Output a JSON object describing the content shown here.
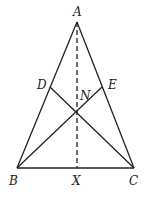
{
  "diagram": {
    "type": "geometry",
    "points": {
      "A": {
        "label": "A",
        "x": 77,
        "y": 22
      },
      "B": {
        "label": "B",
        "x": 17,
        "y": 168
      },
      "C": {
        "label": "C",
        "x": 134,
        "y": 168
      },
      "D": {
        "label": "D",
        "x": 50,
        "y": 87
      },
      "E": {
        "label": "E",
        "x": 102,
        "y": 87
      },
      "N": {
        "label": "N",
        "x": 77,
        "y": 111
      },
      "X": {
        "label": "X",
        "x": 77,
        "y": 168
      }
    },
    "segments": [
      {
        "from": "A",
        "to": "B",
        "style": "solid"
      },
      {
        "from": "A",
        "to": "C",
        "style": "solid"
      },
      {
        "from": "B",
        "to": "C",
        "style": "solid"
      },
      {
        "from": "B",
        "to": "E",
        "style": "solid"
      },
      {
        "from": "C",
        "to": "D",
        "style": "solid"
      },
      {
        "from": "A",
        "to": "X",
        "style": "dashed"
      }
    ],
    "labels": {
      "A": "A",
      "B": "B",
      "C": "C",
      "D": "D",
      "E": "E",
      "N": "N",
      "X": "X"
    }
  }
}
